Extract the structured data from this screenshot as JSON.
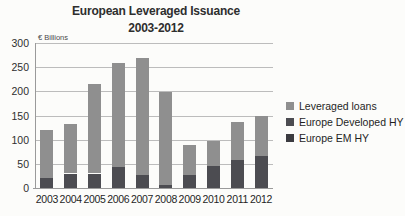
{
  "title": {
    "line1": "European Leveraged Issuance",
    "line2": "2003-2012"
  },
  "y_axis": {
    "unit_label": "€ Billions",
    "tick_labels": [
      "0",
      "50",
      "100",
      "150",
      "200",
      "250",
      "300"
    ]
  },
  "legend": [
    {
      "label": "Leveraged loans",
      "color": "#8f8f8f"
    },
    {
      "label": "Europe Developed HY",
      "color": "#4c4c51"
    },
    {
      "label": "Europe EM HY",
      "color": "#3b3b40"
    }
  ],
  "colors": {
    "background": "#fcfcfa",
    "gridline": "#bcbcbc",
    "axis_line": "#9a9a9a",
    "text": "#2e2e2e"
  },
  "chart_data": {
    "type": "bar",
    "stacked": true,
    "title": "European Leveraged Issuance 2003-2012",
    "xlabel": "",
    "ylabel": "€ Billions",
    "ylim": [
      0,
      300
    ],
    "ytick_step": 50,
    "grid": true,
    "legend_position": "right",
    "categories": [
      "2003",
      "2004",
      "2005",
      "2006",
      "2007",
      "2008",
      "2009",
      "2010",
      "2011",
      "2012"
    ],
    "series": [
      {
        "name": "Europe EM HY",
        "color": "#3b3b40",
        "values": [
          0,
          0,
          0,
          0,
          0,
          0,
          0,
          0,
          0,
          0
        ],
        "note": "segment not visually resolvable in image"
      },
      {
        "name": "Europe Developed HY",
        "color": "#4c4c51",
        "values": [
          20,
          30,
          30,
          43,
          26,
          6,
          27,
          46,
          57,
          67
        ]
      },
      {
        "name": "Leveraged loans",
        "color": "#8f8f8f",
        "values": [
          100,
          103,
          186,
          216,
          244,
          193,
          62,
          51,
          79,
          81
        ]
      }
    ],
    "totals": [
      120,
      133,
      216,
      259,
      270,
      199,
      89,
      97,
      136,
      148
    ]
  }
}
